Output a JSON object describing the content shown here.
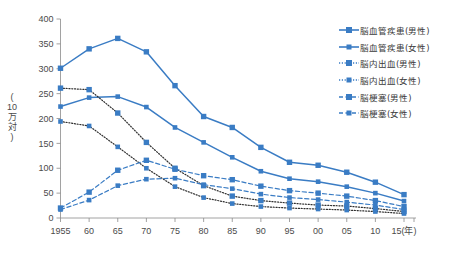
{
  "chart_data": {
    "type": "line",
    "title": "",
    "xlabel": "(年)",
    "ylabel": "(10万対)",
    "ylim": [
      0,
      400
    ],
    "ytick_step": 50,
    "grid": false,
    "legend_position": "right",
    "x": [
      "1955",
      "60",
      "65",
      "70",
      "75",
      "80",
      "85",
      "90",
      "95",
      "00",
      "05",
      "10",
      "15"
    ],
    "x_axis_suffix": "(年)",
    "y_ticks": [
      "0",
      "50",
      "100",
      "150",
      "200",
      "250",
      "300",
      "350",
      "400"
    ],
    "series": [
      {
        "name": "脳血管疾患(男性)",
        "style": "solid",
        "marker": "square",
        "color": "#3a7cc4",
        "values": [
          301,
          340,
          361,
          334,
          266,
          204,
          182,
          142,
          112,
          106,
          92,
          72,
          47
        ]
      },
      {
        "name": "脳血管疾患(女性)",
        "style": "solid",
        "marker": "square",
        "color": "#3a7cc4",
        "values": [
          224,
          242,
          244,
          223,
          182,
          152,
          122,
          94,
          79,
          73,
          63,
          50,
          34
        ]
      },
      {
        "name": "脳内出血(男性)",
        "style": "dotted",
        "marker": "square",
        "color": "#3a7cc4",
        "values": [
          261,
          258,
          211,
          152,
          100,
          65,
          44,
          35,
          30,
          26,
          24,
          19,
          13
        ]
      },
      {
        "name": "脳内出血(女性)",
        "style": "dotted",
        "marker": "square",
        "color": "#3a7cc4",
        "values": [
          194,
          185,
          143,
          100,
          63,
          41,
          29,
          23,
          20,
          18,
          16,
          13,
          9
        ]
      },
      {
        "name": "脳梗塞(男性)",
        "style": "dashed",
        "marker": "square",
        "color": "#3a7cc4",
        "values": [
          20,
          52,
          96,
          116,
          98,
          85,
          77,
          64,
          55,
          50,
          44,
          35,
          23
        ]
      },
      {
        "name": "脳梗塞(女性)",
        "style": "dashed",
        "marker": "square",
        "color": "#3a7cc4",
        "values": [
          17,
          36,
          65,
          78,
          80,
          67,
          59,
          48,
          41,
          37,
          32,
          26,
          17
        ]
      }
    ]
  },
  "legend": {
    "items": [
      {
        "label": "脳血管疾患(男性)",
        "style": "solid"
      },
      {
        "label": "脳血管疾患(女性)",
        "style": "solid"
      },
      {
        "label": "脳内出血(男性)",
        "style": "dotted"
      },
      {
        "label": "脳内出血(女性)",
        "style": "dotted"
      },
      {
        "label": "脳梗塞(男性)",
        "style": "dashed"
      },
      {
        "label": "脳梗塞(女性)",
        "style": "dashed"
      }
    ]
  },
  "axis": {
    "y_label_chars": [
      "(",
      "10",
      "万",
      "対",
      ")"
    ],
    "x_unit": "(年)"
  },
  "colors": {
    "line": "#3a7cc4",
    "axis": "#8a8a8a",
    "text": "#4a4a4a"
  }
}
